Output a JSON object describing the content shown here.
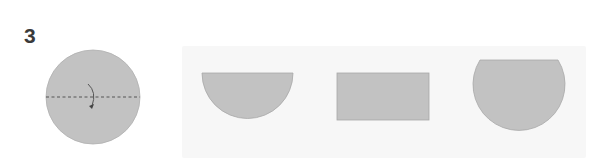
{
  "question": {
    "number": "3"
  },
  "original_figure": {
    "shape": "circle",
    "fold_line": "dashed horizontal diameter",
    "fold_direction_icon": "curved-arrow-icon",
    "fill_color": "#c2c2c2",
    "line_color": "#555555"
  },
  "options_panel": {
    "background": "#f7f7f7",
    "options": [
      {
        "shape": "half-circle",
        "description": "semicircle, flat edge on top"
      },
      {
        "shape": "rectangle",
        "description": "rectangle"
      },
      {
        "shape": "truncated-circle",
        "description": "circle with flat top edge"
      }
    ],
    "shape_fill": "#c2c2c2",
    "shape_stroke": "#a8a8a8"
  }
}
